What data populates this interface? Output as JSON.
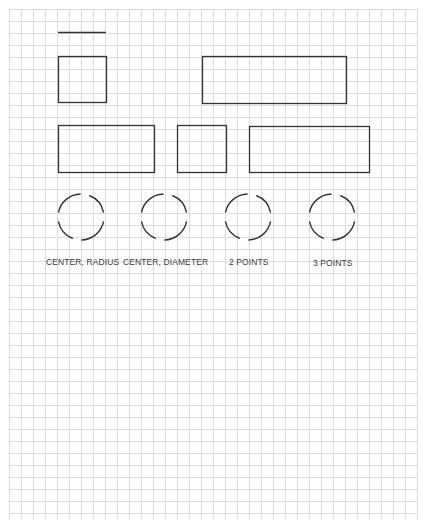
{
  "sheet": {
    "background": "#ffffff",
    "grid": {
      "origin_x": 9,
      "origin_y": 9,
      "end_x": 417,
      "end_y": 519,
      "spacing": 12,
      "color": "#dcdcdc"
    },
    "stroke_color": "#333333"
  },
  "shapes": {
    "line": {
      "x1": 58,
      "y1": 32,
      "x2": 106,
      "y2": 32
    },
    "rectangles": [
      {
        "name": "square-top",
        "x": 58,
        "y": 56,
        "w": 48,
        "h": 46
      },
      {
        "name": "rectangle-top-wide",
        "x": 202,
        "y": 56,
        "w": 144,
        "h": 47
      },
      {
        "name": "rectangle-middle-left",
        "x": 58,
        "y": 125,
        "w": 96,
        "h": 47
      },
      {
        "name": "square-middle",
        "x": 177,
        "y": 125,
        "w": 49,
        "h": 47
      },
      {
        "name": "rectangle-middle-right",
        "x": 249,
        "y": 126,
        "w": 120,
        "h": 46
      }
    ],
    "circles": [
      {
        "name": "circle-center-radius",
        "cx": 81,
        "cy": 217,
        "r": 23,
        "label": "CENTER, RADIUS"
      },
      {
        "name": "circle-center-diameter",
        "cx": 164,
        "cy": 217,
        "r": 23,
        "label": "CENTER, DIAMETER"
      },
      {
        "name": "circle-2-points",
        "cx": 248,
        "cy": 217,
        "r": 23,
        "label": "2 POINTS"
      },
      {
        "name": "circle-3-points",
        "cx": 332,
        "cy": 217,
        "r": 23,
        "label": "3 POINTS"
      }
    ]
  },
  "labels": [
    {
      "text": "CENTER, RADIUS",
      "x": 46,
      "y": 257
    },
    {
      "text": "CENTER, DIAMETER",
      "x": 123,
      "y": 257
    },
    {
      "text": "2 POINTS",
      "x": 229,
      "y": 257
    },
    {
      "text": "3 POINTS",
      "x": 313,
      "y": 258
    }
  ]
}
